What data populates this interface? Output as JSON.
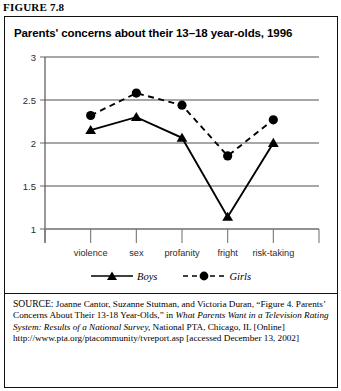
{
  "figure": {
    "label": "FIGURE 7.8"
  },
  "chart_title": "Parents' concerns about their 13–18 year-olds, 1996",
  "legend": {
    "boys_label": "Boys",
    "girls_label": "Girls"
  },
  "source": {
    "prefix": "SOURCE:",
    "line_a": " Joanne Cantor, Suzanne Stutman, and Victoria Duran, “Figure 4. Parents’ Concerns About Their 13-18 Year-Olds,” in ",
    "italic_title": "What Parents Want in a Television Rating System: Results of a National Survey,",
    "line_b": " National PTA, Chicago, IL [Online] http://www.pta.org/ptacommunity/tvreport.asp [accessed December 13, 2002]"
  },
  "chart_data": {
    "type": "line",
    "title": "Parents' concerns about their 13–18 year-olds, 1996",
    "xlabel": "",
    "ylabel": "",
    "categories": [
      "violence",
      "sex",
      "profanity",
      "fright",
      "risk-taking"
    ],
    "series": [
      {
        "name": "Boys",
        "values": [
          2.15,
          2.3,
          2.06,
          1.14,
          2.0
        ],
        "marker": "triangle",
        "line": "solid",
        "color": "#000000"
      },
      {
        "name": "Girls",
        "values": [
          2.32,
          2.58,
          2.44,
          1.85,
          2.27
        ],
        "marker": "circle",
        "line": "dashed",
        "color": "#000000"
      }
    ],
    "ylim": [
      1,
      3
    ],
    "yticks": [
      1,
      1.5,
      2,
      2.5,
      3
    ],
    "ytick_labels": [
      "1",
      "1.5",
      "2",
      "2.5",
      "3"
    ],
    "grid": true,
    "grid_color": "#8a8a8a",
    "legend_position": "bottom"
  }
}
